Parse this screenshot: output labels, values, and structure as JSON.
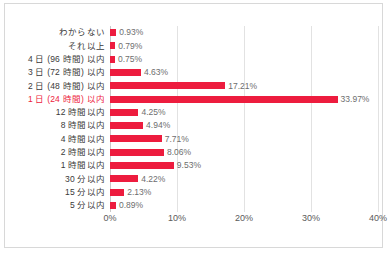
{
  "chart_data": {
    "type": "bar",
    "orientation": "horizontal",
    "title": "",
    "subtitle": "",
    "xlabel": "",
    "ylabel": "",
    "xlim": [
      0,
      40
    ],
    "xticks": [
      "0%",
      "10%",
      "20%",
      "30%",
      "40%"
    ],
    "xtick_values": [
      0,
      10,
      20,
      30,
      40
    ],
    "grid": true,
    "legend": false,
    "bar_color": "#ED1C3E",
    "value_label_color": "#6e6e6e",
    "category_label_color": "#3a3a3a",
    "highlight_color": "#ED1C3E",
    "categories": [
      "わからない",
      "それ以上",
      "4 日 (96 時間) 以内",
      "3 日 (72 時間) 以内",
      "2 日 (48 時間) 以内",
      "1 日 (24 時間) 以内",
      "12 時間以内",
      "8 時間以内",
      "4 時間以内",
      "2 時間以内",
      "1 時間以内",
      "30 分以内",
      "15 分以内",
      "5 分以内"
    ],
    "values": [
      0.93,
      0.79,
      0.75,
      4.63,
      17.21,
      33.97,
      4.25,
      4.94,
      7.71,
      8.06,
      9.53,
      4.22,
      2.13,
      0.89
    ],
    "value_labels": [
      "0.93%",
      "0.79%",
      "0.75%",
      "4.63%",
      "17.21%",
      "33.97%",
      "4.25%",
      "4.94%",
      "7.71%",
      "8.06%",
      "9.53%",
      "4.22%",
      "2.13%",
      "0.89%"
    ],
    "highlighted_category_index": 5
  }
}
